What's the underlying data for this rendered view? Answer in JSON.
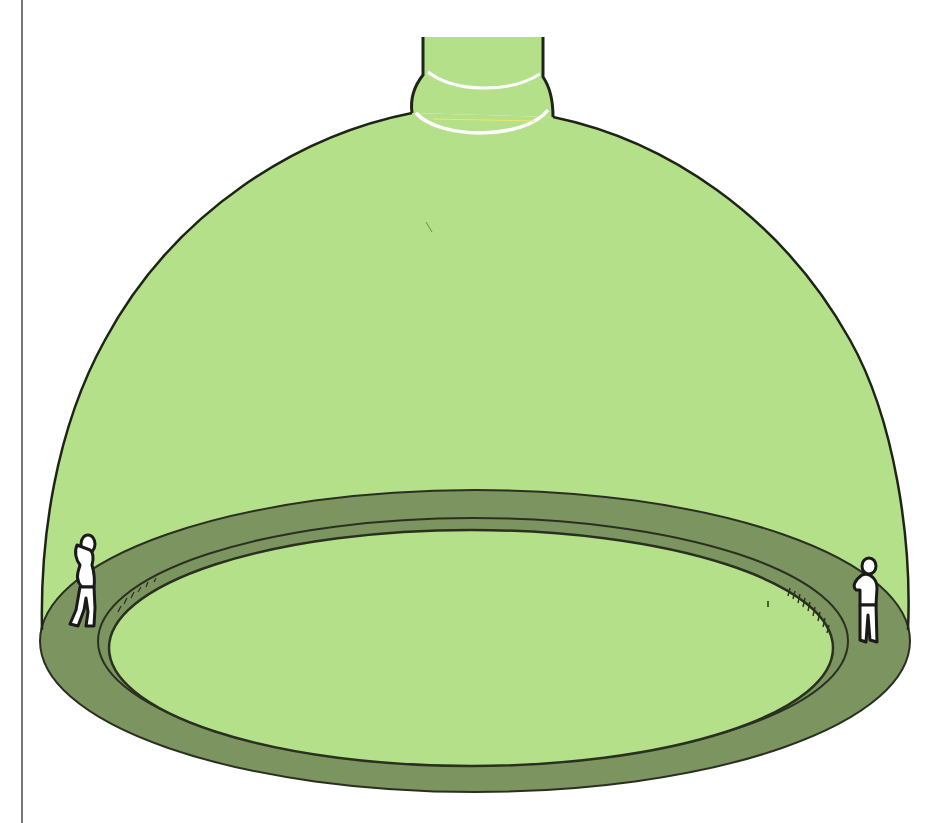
{
  "illustration": {
    "subject": "Hemispherical dome with neck on top and circular gallery walkway inside",
    "figure_count": 2
  },
  "colors": {
    "background": "#ffffff",
    "dome_fill": "#b5e08a",
    "walkway_fill": "#7c9460",
    "outline": "#1f2418",
    "highlight": "#ffffff",
    "yellow_hint": "#f2e56b",
    "figure_fill": "#ffffff"
  },
  "geometry": {
    "margin_line_x": 22,
    "neck": {
      "left_x": 423,
      "right_x": 543,
      "top_y": 37
    },
    "outer_ring": {
      "cx": 475,
      "cy": 641,
      "rx": 435,
      "ry": 151
    },
    "inner_floor": {
      "cx": 471,
      "cy": 648,
      "rx": 362,
      "ry": 118
    }
  }
}
